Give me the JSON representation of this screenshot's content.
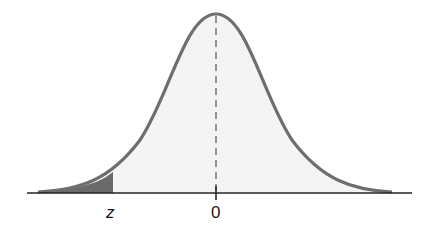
{
  "diagram": {
    "type": "normal-distribution-curve",
    "labels": {
      "z": "z",
      "zero": "0"
    },
    "colors": {
      "curve": "#6e6e6e",
      "fill": "#f4f4f4",
      "shaded_tail": "#6a6a6a",
      "axis": "#222222"
    },
    "shaded_region": "left tail, area below z"
  }
}
